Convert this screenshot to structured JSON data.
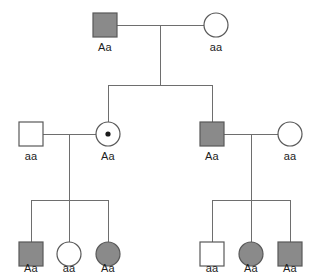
{
  "diagram": {
    "kind": "pedigree-chart",
    "symbol_colors": {
      "affected_fill": "#8a8a8a",
      "unaffected_fill": "#ffffff",
      "symbol_stroke": "#595959",
      "line_stroke": "#6e6e6e",
      "carrier_dot": "#1a1a1a",
      "background": "#ffffff",
      "label_text": "#1d1d1d"
    },
    "generations": [
      {
        "id": "generation-1",
        "individuals": [
          {
            "id": "I-1",
            "sex": "male",
            "shape": "square",
            "status": "affected",
            "carrier": false,
            "genotype": "Aa",
            "x": 105,
            "y": 25
          },
          {
            "id": "I-2",
            "sex": "female",
            "shape": "circle",
            "status": "unaffected",
            "carrier": false,
            "genotype": "aa",
            "x": 216,
            "y": 25
          }
        ]
      },
      {
        "id": "generation-2",
        "individuals": [
          {
            "id": "II-1",
            "sex": "male",
            "shape": "square",
            "status": "unaffected",
            "carrier": false,
            "genotype": "aa",
            "x": 31,
            "y": 134
          },
          {
            "id": "II-2",
            "sex": "female",
            "shape": "circle",
            "status": "unaffected",
            "carrier": true,
            "genotype": "Aa",
            "x": 108,
            "y": 134
          },
          {
            "id": "II-3",
            "sex": "male",
            "shape": "square",
            "status": "affected",
            "carrier": false,
            "genotype": "Aa",
            "x": 212,
            "y": 134
          },
          {
            "id": "II-4",
            "sex": "female",
            "shape": "circle",
            "status": "unaffected",
            "carrier": false,
            "genotype": "aa",
            "x": 290,
            "y": 134
          }
        ]
      },
      {
        "id": "generation-3",
        "individuals": [
          {
            "id": "III-1",
            "sex": "male",
            "shape": "square",
            "status": "affected",
            "carrier": false,
            "genotype": "Aa",
            "x": 31,
            "y": 254
          },
          {
            "id": "III-2",
            "sex": "female",
            "shape": "circle",
            "status": "unaffected",
            "carrier": false,
            "genotype": "aa",
            "x": 69,
            "y": 254
          },
          {
            "id": "III-3",
            "sex": "female",
            "shape": "circle",
            "status": "affected",
            "carrier": false,
            "genotype": "Aa",
            "x": 108,
            "y": 254
          },
          {
            "id": "III-4",
            "sex": "male",
            "shape": "square",
            "status": "unaffected",
            "carrier": false,
            "genotype": "aa",
            "x": 212,
            "y": 254
          },
          {
            "id": "III-5",
            "sex": "female",
            "shape": "circle",
            "status": "affected",
            "carrier": false,
            "genotype": "Aa",
            "x": 251,
            "y": 254
          },
          {
            "id": "III-6",
            "sex": "male",
            "shape": "square",
            "status": "affected",
            "carrier": false,
            "genotype": "Aa",
            "x": 290,
            "y": 254
          }
        ]
      }
    ],
    "labels": {
      "i1": "Aa",
      "i2": "aa",
      "ii1": "aa",
      "ii2": "Aa",
      "ii3": "Aa",
      "ii4": "aa",
      "iii1": "Aa",
      "iii2": "aa",
      "iii3": "Aa",
      "iii4": "aa",
      "iii5": "Aa",
      "iii6": "Aa"
    }
  }
}
